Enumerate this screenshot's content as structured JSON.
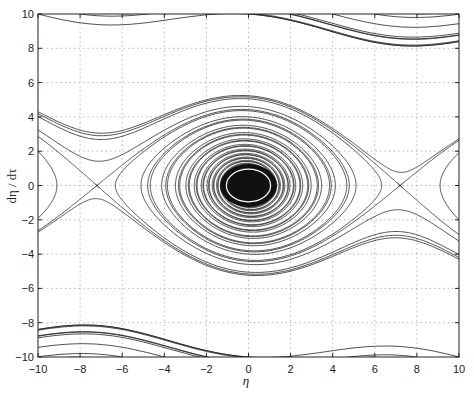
{
  "chart_data": {
    "type": "line",
    "title": "",
    "xlabel": "η",
    "ylabel": "dη / dτ",
    "xlim": [
      -10,
      10
    ],
    "ylim": [
      -10,
      10
    ],
    "xticks": [
      -10,
      -8,
      -6,
      -4,
      -2,
      0,
      2,
      4,
      6,
      8,
      10
    ],
    "yticks": [
      -10,
      -8,
      -6,
      -4,
      -2,
      0,
      2,
      4,
      6,
      8,
      10
    ],
    "xtick_labels": [
      "−10",
      "−8",
      "−6",
      "−4",
      "−2",
      "0",
      "2",
      "4",
      "6",
      "8",
      "10"
    ],
    "ytick_labels": [
      "−10",
      "−8",
      "−6",
      "−4",
      "−2",
      "0",
      "2",
      "4",
      "6",
      "8",
      "10"
    ],
    "grid": "dotted",
    "legend": null,
    "fixed_points": [
      {
        "type": "focus",
        "eta": 0,
        "deta": 0
      },
      {
        "type": "saddle",
        "eta": -7.2,
        "deta": 0
      },
      {
        "type": "saddle",
        "eta": 7.2,
        "deta": 0
      }
    ],
    "model": {
      "k": 2.5,
      "L": 7.2,
      "damping": 0.08,
      "dt": 0.02,
      "steps": 6000
    },
    "seeds": {
      "top_edge_eta": [
        -10,
        -8,
        -6,
        -4,
        -2,
        0,
        2,
        4,
        6,
        8
      ],
      "top_edge_deta": 10,
      "bottom_edge_eta": [
        -8,
        -6,
        -4,
        -2,
        0,
        2,
        4,
        6,
        8,
        10
      ],
      "bottom_edge_deta": -10,
      "left_edge_eta": -10,
      "left_edge_deta": [
        -9.2,
        -8.6,
        -6.8,
        -6,
        -5.6,
        -5.2,
        -4.9,
        -4.75,
        -4.6,
        -4.5,
        -2,
        0,
        2,
        4.3
      ],
      "right_edge_eta": 10,
      "right_edge_deta": [
        9.2,
        8.6,
        6.8,
        6,
        5.6,
        5.2,
        4.9,
        4.75,
        4.6,
        4.5,
        2,
        0,
        -2,
        -4.3
      ],
      "interior": [
        [
          -7.15,
          0.05
        ],
        [
          7.15,
          -0.05
        ],
        [
          -7.25,
          -0.05
        ],
        [
          7.25,
          0.05
        ],
        [
          0,
          4.6
        ],
        [
          0,
          -4.6
        ],
        [
          0,
          3.8
        ],
        [
          0,
          -3.8
        ]
      ]
    }
  },
  "axes": {
    "x_label": "η",
    "y_label": "dη / dτ"
  }
}
